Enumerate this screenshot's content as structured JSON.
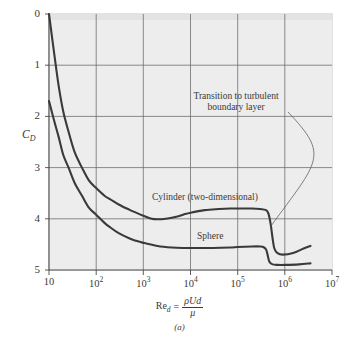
{
  "figure": {
    "panel_id": "(a)",
    "background_color": "#ffffff",
    "plot_background_color": "#ededed",
    "curve_color": "#3a3a3a"
  },
  "axes": {
    "y_title": "C",
    "y_title_sub": "D",
    "y_ticks": [
      "5",
      "4",
      "3",
      "2",
      "1",
      "0"
    ],
    "x_ticks": [
      {
        "mantissa": "10",
        "exp": ""
      },
      {
        "mantissa": "10",
        "exp": "2"
      },
      {
        "mantissa": "10",
        "exp": "3"
      },
      {
        "mantissa": "10",
        "exp": "4"
      },
      {
        "mantissa": "10",
        "exp": "5"
      },
      {
        "mantissa": "10",
        "exp": "6"
      },
      {
        "mantissa": "10",
        "exp": "7"
      }
    ],
    "x_title": {
      "symbol": "Re",
      "symbol_sub": "d",
      "equals": "=",
      "numerator": "ρUd",
      "denominator": "μ"
    }
  },
  "annotations": {
    "transition_line1": "Transition to turbulent",
    "transition_line2": "boundary layer",
    "cylinder_label": "Cylinder (two-dimensional)",
    "sphere_label": "Sphere"
  },
  "chart_data": {
    "type": "line",
    "title": "",
    "subtitle": "(a)",
    "xlabel": "Re_d = ρUd/μ",
    "ylabel": "C_D",
    "xscale": "log",
    "yscale": "linear",
    "xlim": [
      10,
      10000000
    ],
    "ylim": [
      0,
      5
    ],
    "grid": true,
    "xticks": [
      10,
      100,
      1000,
      10000,
      100000,
      1000000,
      10000000
    ],
    "yticks": [
      0,
      1,
      2,
      3,
      4,
      5
    ],
    "legend_position": "inline-labels",
    "annotations": [
      {
        "text": "Transition to turbulent boundary layer",
        "points_to": {
          "x": 500000,
          "y": 0.85
        }
      }
    ],
    "series": [
      {
        "name": "Cylinder (two-dimensional)",
        "x": [
          10,
          13,
          16,
          20,
          26,
          35,
          50,
          70,
          100,
          150,
          200,
          300,
          500,
          700,
          1000,
          1500,
          2000,
          3000,
          5000,
          7000,
          10000,
          20000,
          40000,
          70000,
          100000,
          200000,
          300000,
          400000,
          450000,
          500000,
          550000,
          600000,
          700000,
          900000,
          1500000,
          2500000,
          3500000
        ],
        "y": [
          5.0,
          4.2,
          3.6,
          3.1,
          2.7,
          2.3,
          2.0,
          1.75,
          1.6,
          1.45,
          1.38,
          1.28,
          1.18,
          1.12,
          1.06,
          1.0,
          0.99,
          1.0,
          1.04,
          1.08,
          1.12,
          1.17,
          1.19,
          1.2,
          1.2,
          1.2,
          1.19,
          1.17,
          1.1,
          0.9,
          0.62,
          0.42,
          0.33,
          0.3,
          0.33,
          0.42,
          0.47
        ]
      },
      {
        "name": "Sphere",
        "x": [
          10,
          13,
          16,
          20,
          26,
          35,
          50,
          70,
          100,
          150,
          200,
          300,
          500,
          700,
          1000,
          2000,
          4000,
          7000,
          10000,
          30000,
          70000,
          100000,
          200000,
          300000,
          350000,
          400000,
          430000,
          470000,
          550000,
          700000,
          1000000,
          2000000,
          3500000
        ],
        "y": [
          3.3,
          2.9,
          2.6,
          2.25,
          2.0,
          1.7,
          1.45,
          1.22,
          1.08,
          0.92,
          0.83,
          0.72,
          0.62,
          0.57,
          0.53,
          0.47,
          0.44,
          0.43,
          0.43,
          0.43,
          0.44,
          0.45,
          0.46,
          0.46,
          0.45,
          0.4,
          0.3,
          0.16,
          0.11,
          0.1,
          0.1,
          0.11,
          0.13
        ]
      }
    ]
  }
}
